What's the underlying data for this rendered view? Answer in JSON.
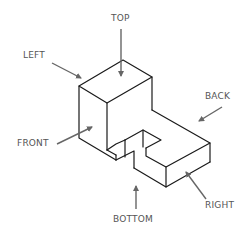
{
  "diagram": {
    "type": "isometric-view-orientation",
    "labels": {
      "top": "TOP",
      "left": "LEFT",
      "back": "BACK",
      "front": "FRONT",
      "bottom": "BOTTOM",
      "right": "RIGHT"
    },
    "colors": {
      "edges": "#1a1a1a",
      "arrows": "#666666",
      "text": "#555555",
      "background": "#ffffff"
    }
  }
}
